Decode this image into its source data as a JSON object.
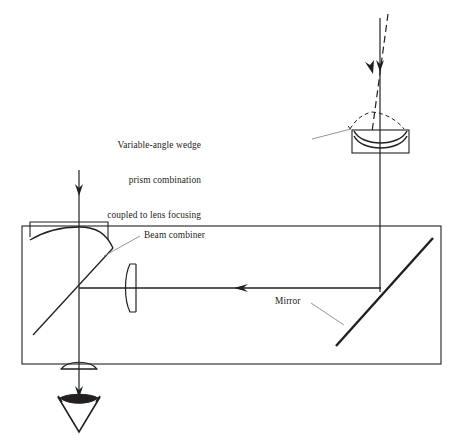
{
  "figure": {
    "background_color": "#ffffff",
    "line_color": "#231f20",
    "leader_color": "#6b6b6b",
    "width": 458,
    "height": 443
  },
  "labels": {
    "wedge_prism": {
      "line1": "Variable-angle wedge",
      "line2": "prism combination",
      "line3": "coupled to lens focusing",
      "x": 201,
      "y": 122,
      "align": "right"
    },
    "beam_combiner": {
      "text": "Beam combiner",
      "x": 144,
      "y": 236,
      "align": "left"
    },
    "mirror": {
      "text": "Mirror",
      "x": 275,
      "y": 299,
      "align": "left"
    }
  },
  "components": [
    {
      "name": "enclosure",
      "type": "rectangle",
      "x1": 22,
      "y1": 226,
      "x2": 441,
      "y2": 364
    },
    {
      "name": "concave-mirror",
      "type": "curved-mirror",
      "x1": 30,
      "y1": 222,
      "x2": 108,
      "y2": 238
    },
    {
      "name": "beam-combiner",
      "type": "beamsplitter-diagonal",
      "x1": 33,
      "y1": 335,
      "x2": 113,
      "y2": 247
    },
    {
      "name": "negative-lens",
      "type": "plano-concave-lens",
      "x": 128,
      "y": 288,
      "width": 14,
      "height": 48
    },
    {
      "name": "fold-mirror",
      "type": "flat-mirror-diagonal",
      "x1": 336,
      "y1": 346,
      "x2": 433,
      "y2": 238
    },
    {
      "name": "wedge-prism-lens-assembly",
      "type": "wedge-prism-with-lens",
      "x": 352,
      "y": 130,
      "width": 57,
      "height": 23
    },
    {
      "name": "output-lens",
      "type": "biconvex-lens",
      "x": 79,
      "y": 363,
      "width": 36,
      "height": 11
    },
    {
      "name": "eye-detector",
      "type": "eye-symbol",
      "x": 79,
      "y": 398
    }
  ],
  "rays": [
    {
      "name": "input-ray-left",
      "style": "solid",
      "direction": "down",
      "x1": 79,
      "y1": 170,
      "x2": 79,
      "y2": 364
    },
    {
      "name": "input-ray-right-solid",
      "style": "solid",
      "direction": "down",
      "x1": 380,
      "y1": 18,
      "x2": 380,
      "y2": 292
    },
    {
      "name": "input-ray-right-dashed",
      "style": "dashed",
      "direction": "down-right",
      "x1": 388,
      "y1": 14,
      "x2": 379,
      "y2": 131
    },
    {
      "name": "cavity-ray-horizontal",
      "style": "solid",
      "direction": "left",
      "x1": 380,
      "y1": 288,
      "x2": 79,
      "y2": 288
    },
    {
      "name": "output-ray-down",
      "style": "solid",
      "direction": "down",
      "x1": 79,
      "y1": 364,
      "x2": 79,
      "y2": 397
    }
  ]
}
